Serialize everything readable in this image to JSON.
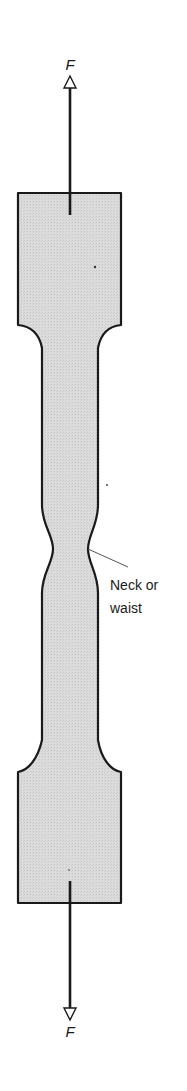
{
  "diagram": {
    "colors": {
      "fill": "#d9d9d9",
      "stroke": "#1a1a1a",
      "background": "#ffffff",
      "leader": "#555555"
    },
    "forces": {
      "top_label": "F",
      "bottom_label": "F"
    },
    "annotation": {
      "line1": "Neck or",
      "line2": "waist"
    }
  }
}
